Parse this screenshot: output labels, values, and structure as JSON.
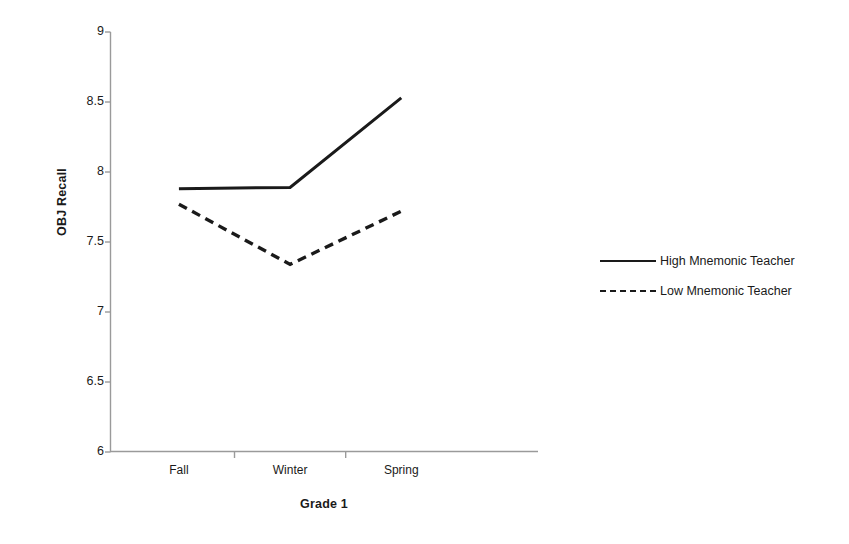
{
  "chart_data": {
    "type": "line",
    "title": "",
    "xlabel": "Grade 1",
    "ylabel": "OBJ Recall",
    "categories": [
      "Fall",
      "Winter",
      "Spring"
    ],
    "ylim": [
      6,
      9
    ],
    "yticks": [
      "6",
      "6.5",
      "7",
      "7.5",
      "8",
      "8.5",
      "9"
    ],
    "ytick_values": [
      6,
      6.5,
      7,
      7.5,
      8,
      8.5,
      9
    ],
    "grid": false,
    "legend_position": "right",
    "series": [
      {
        "name": "High Mnemonic Teacher",
        "style": "solid",
        "color": "#1a1a1a",
        "values": [
          7.88,
          7.89,
          8.53
        ]
      },
      {
        "name": "Low Mnemonic Teacher",
        "style": "dashed",
        "color": "#1a1a1a",
        "values": [
          7.77,
          7.34,
          7.72
        ]
      }
    ]
  },
  "axes": {
    "y_title": "OBJ Recall",
    "x_title": "Grade 1"
  },
  "legend": {
    "items": [
      {
        "label": "High Mnemonic Teacher",
        "style": "solid"
      },
      {
        "label": "Low Mnemonic Teacher",
        "style": "dashed"
      }
    ]
  }
}
